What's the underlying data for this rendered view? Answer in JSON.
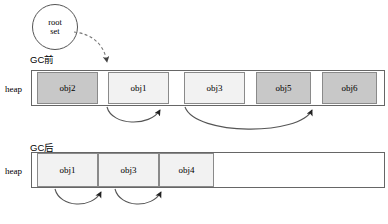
{
  "diagram": {
    "title_before": "GC前",
    "title_after": "GC后",
    "root_set": {
      "line1": "root",
      "line2": "set"
    },
    "heap_label": "heap",
    "colors": {
      "shaded_fill": "#c8c8c8",
      "light_fill": "#f2f2f2",
      "cell_border": "#8a8a8a",
      "bar_border": "#666666",
      "arrow_stroke": "#555555",
      "root_arrow_stroke": "#777777",
      "background": "#ffffff"
    },
    "before": {
      "label": "GC前",
      "heap_label": "heap",
      "cells": [
        {
          "label": "obj2",
          "state": "shaded",
          "x": 5,
          "width": 61
        },
        {
          "label": "obj1",
          "state": "light",
          "x": 76,
          "width": 61
        },
        {
          "label": "obj3",
          "state": "light",
          "x": 152,
          "width": 61
        },
        {
          "label": "obj5",
          "state": "shaded",
          "x": 224,
          "width": 55
        },
        {
          "label": "obj6",
          "state": "shaded",
          "x": 290,
          "width": 55
        },
        {
          "label": "obj4",
          "state": "light",
          "x": 358,
          "width": 55
        }
      ]
    },
    "after": {
      "label": "GC后",
      "heap_label": "heap",
      "cells": [
        {
          "label": "obj1",
          "state": "light",
          "x": 5,
          "width": 61
        },
        {
          "label": "obj3",
          "state": "light",
          "x": 66,
          "width": 61
        },
        {
          "label": "obj4",
          "state": "light",
          "x": 127,
          "width": 55
        }
      ]
    },
    "references": {
      "root_to_obj1": "root set references obj1",
      "before_obj1_to_obj3": "obj1 references obj3",
      "before_obj3_to_obj4": "obj3 references obj4",
      "after_obj1_to_obj3": "obj1 references obj3",
      "after_obj3_to_obj4": "obj3 references obj4"
    }
  }
}
